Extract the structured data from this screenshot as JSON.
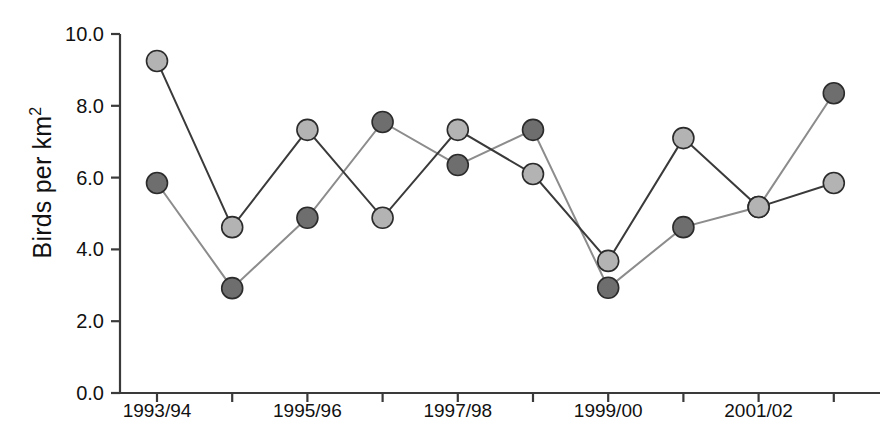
{
  "chart_data": {
    "type": "line",
    "title": "",
    "subtitle": "",
    "xlabel": "",
    "ylabel": "Birds per km2",
    "ylabel_display": "Birds per km",
    "ylabel_superscript": "2",
    "categories": [
      "1993/94",
      "1994/95",
      "1995/96",
      "1996/97",
      "1997/98",
      "1998/99",
      "1999/00",
      "2000/01",
      "2001/02",
      "2002/03"
    ],
    "x_tick_labels": [
      "1993/94",
      "",
      "1995/96",
      "",
      "1997/98",
      "",
      "1999/00",
      "",
      "2001/02",
      ""
    ],
    "y_tick_labels": [
      "0.0",
      "2.0",
      "4.0",
      "6.0",
      "8.0",
      "10.0"
    ],
    "y_ticks": [
      0,
      2,
      4,
      6,
      8,
      10
    ],
    "ylim": [
      0,
      10
    ],
    "grid": false,
    "legend": "none",
    "series": [
      {
        "name": "series-light",
        "marker": "circle-light",
        "color": "#b3b3b3",
        "line_color": "#3a3a3a",
        "values": [
          9.25,
          4.62,
          7.33,
          4.88,
          7.33,
          6.1,
          3.68,
          7.1,
          5.18,
          5.85
        ]
      },
      {
        "name": "series-dark",
        "marker": "circle-dark",
        "color": "#6e6e6e",
        "line_color": "#8c8c8c",
        "values": [
          5.85,
          2.92,
          4.88,
          7.55,
          6.35,
          7.33,
          2.93,
          4.62,
          5.18,
          8.35
        ]
      }
    ],
    "colors": {
      "light_marker_fill": "#b3b3b3",
      "dark_marker_fill": "#6e6e6e",
      "marker_stroke": "#2b2b2b",
      "dark_line": "#3a3a3a",
      "light_line": "#8c8c8c",
      "axis": "#3a3a3a",
      "text": "#111111",
      "background": "#ffffff"
    }
  }
}
